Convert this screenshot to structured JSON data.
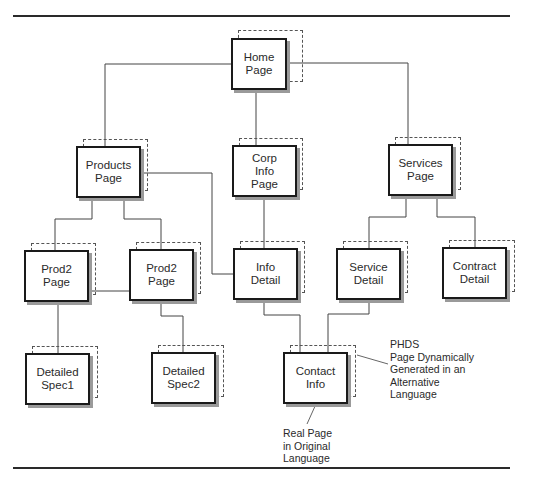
{
  "nodes": {
    "home": {
      "label": "Home\nPage"
    },
    "products": {
      "label": "Products\nPage"
    },
    "corp": {
      "label": "Corp\nInfo\nPage"
    },
    "services": {
      "label": "Services\nPage"
    },
    "prod2a": {
      "label": "Prod2\nPage"
    },
    "prod2b": {
      "label": "Prod2\nPage"
    },
    "info_detail": {
      "label": "Info\nDetail"
    },
    "service_detail": {
      "label": "Service\nDetail"
    },
    "contract_detail": {
      "label": "Contract\nDetail"
    },
    "spec1": {
      "label": "Detailed\nSpec1"
    },
    "spec2": {
      "label": "Detailed\nSpec2"
    },
    "contact": {
      "label": "Contact\nInfo"
    }
  },
  "annotations": {
    "phds": "PHDS\nPage Dynamically\nGenerated in an\nAlternative\nLanguage",
    "real_page": "Real Page\nin Original\nLanguage"
  },
  "colors": {
    "line": "#444444",
    "box_border": "#1a1a1a",
    "shadow": "#9a9a9a"
  }
}
